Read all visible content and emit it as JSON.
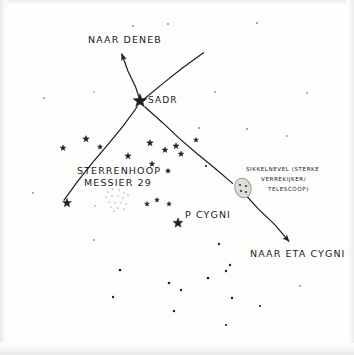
{
  "chart_data": {
    "type": "scatter",
    "subtitle": "",
    "xlabel": "",
    "ylabel": "",
    "grid": false,
    "legend_position": "none",
    "xlim": [
      0,
      354
    ],
    "ylim": [
      0,
      355
    ],
    "style": {
      "background_color": "#fdfdfc",
      "ink_color": "#22201f",
      "faint_ink_color": "#b9b7b4",
      "nebula_fill_color": "#dedcd9",
      "nebula_stroke_color": "#9c9a97"
    },
    "annotations": [
      {
        "id": "naar-deneb",
        "text": "NAAR DENEB",
        "x": 88,
        "y": 34,
        "size": "lg",
        "align": "left"
      },
      {
        "id": "sadr",
        "text": "SADR",
        "x": 148,
        "y": 95,
        "size": "md",
        "align": "left"
      },
      {
        "id": "sterrenhoop-m29",
        "text": "STERRENHOOP",
        "x": 77,
        "y": 165,
        "size": "lg",
        "align": "left"
      },
      {
        "id": "messier-29",
        "text": "MESSIER 29",
        "x": 84,
        "y": 177,
        "size": "lg",
        "align": "left"
      },
      {
        "id": "p-cygni",
        "text": "P CYGNI",
        "x": 185,
        "y": 209,
        "size": "lg",
        "align": "left"
      },
      {
        "id": "naar-eta-cygni",
        "text": "NAAR ETA CYGNI",
        "x": 250,
        "y": 248,
        "size": "lg",
        "align": "left"
      },
      {
        "id": "sikkelnevel",
        "text": "SIKKELNEVEL (STERKE",
        "x": 246,
        "y": 166,
        "size": "sm",
        "align": "left"
      },
      {
        "id": "verrekijker",
        "text": "VERREKIJKER/",
        "x": 261,
        "y": 176,
        "size": "sm",
        "align": "left"
      },
      {
        "id": "telescoop",
        "text": "TELESCOOP)",
        "x": 268,
        "y": 186,
        "size": "sm",
        "align": "left"
      }
    ],
    "lines": [
      {
        "id": "deneb-arrow",
        "x1": 141,
        "y1": 103,
        "x2": 122,
        "y2": 54,
        "arrow": true,
        "note": "from Sadr to Deneb"
      },
      {
        "id": "sadr-upper-right",
        "x1": 143,
        "y1": 100,
        "x2": 203,
        "y2": 52,
        "arrow": false,
        "note": "Cygnus wing to upper right"
      },
      {
        "id": "sadr-lower-left",
        "x1": 137,
        "y1": 107,
        "x2": 64,
        "y2": 200,
        "arrow": false,
        "note": "Cygnus wing to lower left"
      },
      {
        "id": "sadr-lower-right",
        "x1": 145,
        "y1": 107,
        "x2": 232,
        "y2": 184,
        "arrow": false,
        "note": "spine toward nebula"
      },
      {
        "id": "eta-cygni-arrow",
        "x1": 243,
        "y1": 192,
        "x2": 289,
        "y2": 241,
        "arrow": true,
        "note": "from nebula to Eta Cygni"
      }
    ],
    "nebula": {
      "id": "sikkelnevel",
      "cx": 243,
      "cy": 188,
      "rx": 8,
      "ry": 10,
      "rotation": -20,
      "inner_dots": [
        {
          "x": 240,
          "y": 185
        },
        {
          "x": 246,
          "y": 186
        },
        {
          "x": 241,
          "y": 191
        },
        {
          "x": 246,
          "y": 192
        }
      ]
    },
    "cluster": {
      "id": "messier-29-stipple",
      "cx": 117,
      "cy": 199,
      "dots": [
        {
          "x": 108,
          "y": 192
        },
        {
          "x": 113,
          "y": 189
        },
        {
          "x": 119,
          "y": 190
        },
        {
          "x": 124,
          "y": 193
        },
        {
          "x": 106,
          "y": 197
        },
        {
          "x": 112,
          "y": 196
        },
        {
          "x": 118,
          "y": 196
        },
        {
          "x": 123,
          "y": 198
        },
        {
          "x": 128,
          "y": 195
        },
        {
          "x": 109,
          "y": 202
        },
        {
          "x": 115,
          "y": 203
        },
        {
          "x": 121,
          "y": 203
        },
        {
          "x": 126,
          "y": 204
        },
        {
          "x": 111,
          "y": 207
        },
        {
          "x": 118,
          "y": 208
        },
        {
          "x": 124,
          "y": 209
        },
        {
          "x": 114,
          "y": 211
        }
      ]
    },
    "stars_bright": [
      {
        "id": "sadr",
        "x": 140,
        "y": 101,
        "r": 7.2,
        "label": "SADR"
      },
      {
        "id": "p-cygni",
        "x": 178,
        "y": 223,
        "r": 5.2,
        "label": "P CYGNI"
      },
      {
        "id": "star-left-1",
        "x": 67,
        "y": 203,
        "r": 4.6,
        "label": ""
      },
      {
        "id": "star-left-2",
        "x": 86,
        "y": 139,
        "r": 3.4,
        "label": ""
      },
      {
        "id": "star-left-3",
        "x": 63,
        "y": 148,
        "r": 3.0,
        "label": ""
      },
      {
        "id": "star-mid-1",
        "x": 150,
        "y": 143,
        "r": 3.4,
        "label": ""
      },
      {
        "id": "star-mid-2",
        "x": 176,
        "y": 146,
        "r": 3.2,
        "label": ""
      },
      {
        "id": "star-mid-3",
        "x": 165,
        "y": 150,
        "r": 3.0,
        "label": ""
      },
      {
        "id": "star-mid-4",
        "x": 181,
        "y": 154,
        "r": 2.9,
        "label": ""
      },
      {
        "id": "star-mid-5",
        "x": 128,
        "y": 156,
        "r": 3.3,
        "label": ""
      },
      {
        "id": "star-mid-6",
        "x": 152,
        "y": 164,
        "r": 2.8,
        "label": ""
      },
      {
        "id": "star-mid-7",
        "x": 100,
        "y": 147,
        "r": 2.6,
        "label": ""
      },
      {
        "id": "star-mid-8",
        "x": 168,
        "y": 171,
        "r": 2.6,
        "label": ""
      },
      {
        "id": "star-mid-9",
        "x": 147,
        "y": 204,
        "r": 2.5,
        "label": ""
      },
      {
        "id": "star-mid-10",
        "x": 157,
        "y": 200,
        "r": 2.4,
        "label": ""
      },
      {
        "id": "star-mid-11",
        "x": 169,
        "y": 204,
        "r": 2.4,
        "label": ""
      },
      {
        "id": "star-mid-12",
        "x": 196,
        "y": 140,
        "r": 2.5,
        "label": ""
      }
    ],
    "stars_faint": [
      {
        "id": "dot-01",
        "x": 133,
        "y": 26,
        "r": 0.9
      },
      {
        "id": "dot-02",
        "x": 168,
        "y": 24,
        "r": 1.0
      },
      {
        "id": "dot-03",
        "x": 257,
        "y": 23,
        "r": 1.0
      },
      {
        "id": "dot-04",
        "x": 44,
        "y": 98,
        "r": 0.9
      },
      {
        "id": "dot-05",
        "x": 94,
        "y": 92,
        "r": 0.8
      },
      {
        "id": "dot-06",
        "x": 215,
        "y": 92,
        "r": 0.9
      },
      {
        "id": "dot-07",
        "x": 307,
        "y": 93,
        "r": 0.9
      },
      {
        "id": "dot-08",
        "x": 199,
        "y": 128,
        "r": 1.0
      },
      {
        "id": "dot-09",
        "x": 247,
        "y": 129,
        "r": 1.0
      },
      {
        "id": "dot-10",
        "x": 287,
        "y": 136,
        "r": 0.9
      },
      {
        "id": "dot-11",
        "x": 206,
        "y": 166,
        "r": 1.1
      },
      {
        "id": "dot-12",
        "x": 33,
        "y": 193,
        "r": 0.9
      },
      {
        "id": "dot-13",
        "x": 95,
        "y": 206,
        "r": 0.8
      },
      {
        "id": "dot-14",
        "x": 94,
        "y": 240,
        "r": 0.9
      },
      {
        "id": "dot-15",
        "x": 219,
        "y": 244,
        "r": 1.2
      },
      {
        "id": "dot-16",
        "x": 230,
        "y": 265,
        "r": 1.2
      },
      {
        "id": "dot-17",
        "x": 120,
        "y": 270,
        "r": 1.3
      },
      {
        "id": "dot-18",
        "x": 113,
        "y": 297,
        "r": 1.2
      },
      {
        "id": "dot-19",
        "x": 169,
        "y": 283,
        "r": 1.3
      },
      {
        "id": "dot-20",
        "x": 181,
        "y": 290,
        "r": 1.2
      },
      {
        "id": "dot-21",
        "x": 208,
        "y": 278,
        "r": 1.3
      },
      {
        "id": "dot-22",
        "x": 226,
        "y": 271,
        "r": 1.2
      },
      {
        "id": "dot-23",
        "x": 232,
        "y": 298,
        "r": 1.2
      },
      {
        "id": "dot-24",
        "x": 174,
        "y": 311,
        "r": 1.2
      },
      {
        "id": "dot-25",
        "x": 226,
        "y": 325,
        "r": 1.1
      },
      {
        "id": "dot-26",
        "x": 260,
        "y": 306,
        "r": 1.1
      },
      {
        "id": "dot-27",
        "x": 300,
        "y": 286,
        "r": 0.9
      }
    ]
  }
}
